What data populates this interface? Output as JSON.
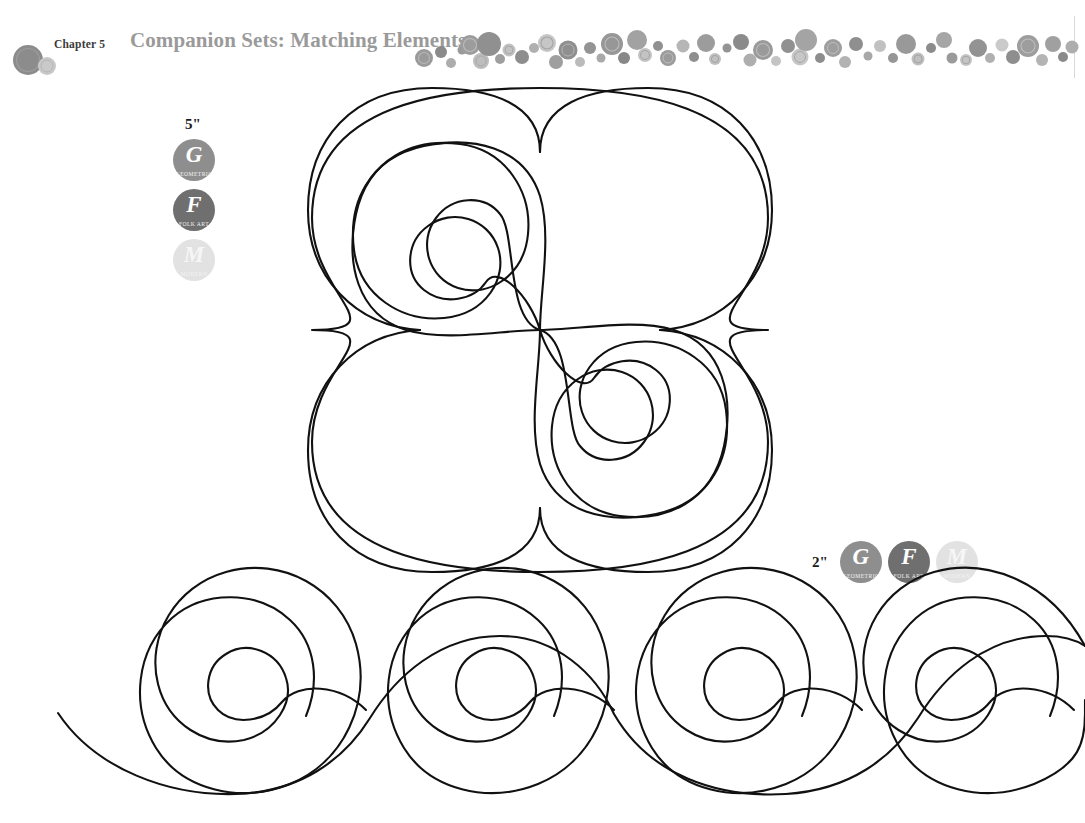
{
  "page": {
    "background_color": "#ffffff",
    "ink_color": "#111111"
  },
  "header": {
    "chapter_prefix": "Chapter",
    "chapter_number": "5",
    "chapter_label": "Chapter 5",
    "title": "Companion Sets: Matching Elements",
    "title_color": "#9a9a9a",
    "chapter_label_color": "#3a3a3a",
    "decor_icon": "bubble-dots-band"
  },
  "badge_styles": {
    "geometric_color": "#8e8e8e",
    "folkart_color": "#6f6f6f",
    "modern_color": "#e2e2e2"
  },
  "badge_groups": [
    {
      "id": "left",
      "size_label": "5\"",
      "orientation": "vertical",
      "badges": [
        {
          "letter": "G",
          "caption": "Geometric",
          "style": "geo"
        },
        {
          "letter": "F",
          "caption": "Folk Art",
          "style": "folk"
        },
        {
          "letter": "M",
          "caption": "Modern",
          "style": "mod"
        }
      ]
    },
    {
      "id": "right",
      "size_label": "2\"",
      "orientation": "horizontal",
      "badges": [
        {
          "letter": "G",
          "caption": "Geometric",
          "style": "geo"
        },
        {
          "letter": "F",
          "caption": "Folk Art",
          "style": "folk"
        },
        {
          "letter": "M",
          "caption": "Modern",
          "style": "mod"
        }
      ]
    }
  ],
  "artwork": {
    "block_motif": {
      "name": "four-lobe-spiral-block",
      "size_inches": "5\"",
      "center_x": 540,
      "center_y": 330,
      "lobes": 4,
      "description": "Four-fold rotationally symmetric quilting block: four rounded lobes with nested spiral scrolls converging at a single center point."
    },
    "border_motif": {
      "name": "running-spiral-border",
      "size_inches": "2\"",
      "repeats": 4,
      "description": "Continuous undulating line border with four clockwise spiral scrolls."
    }
  }
}
